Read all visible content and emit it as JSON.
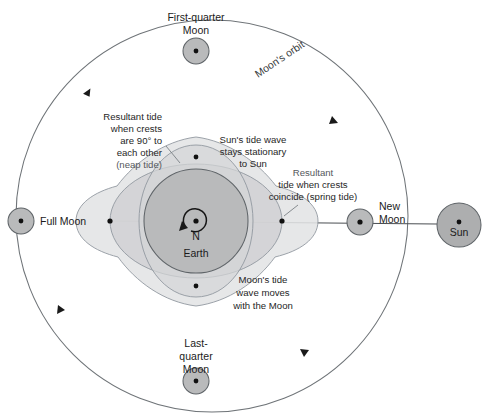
{
  "diagram": {
    "canvas": {
      "width": 492,
      "height": 414
    },
    "colors": {
      "background": "#ffffff",
      "earth_fill": "#b9babb",
      "moon_fill": "#b9babb",
      "sun_fill": "#adaeaf",
      "sun_tide_fill": "#d2d3d4",
      "moon_tide_fill": "#d7d8d9",
      "resultant_fill": "#e2e3e4",
      "outline": "#5f6468",
      "orbit_stroke": "#6f7478",
      "text": "#1b1b1b"
    },
    "geometry": {
      "earth_center": {
        "x": 196,
        "y": 221
      },
      "earth_radius": 52,
      "orbit_center": {
        "x": 212,
        "y": 216
      },
      "orbit_radius_x": 196,
      "orbit_radius_y": 196,
      "sun_center": {
        "x": 459,
        "y": 225
      },
      "sun_radius": 22,
      "moon_radius": 13,
      "sun_tide_rx": 86,
      "sun_tide_ry": 57,
      "moon_tide_rx": 57,
      "moon_tide_ry": 76,
      "resultant_lobe_scale": 1.0
    }
  },
  "bodies": [
    {
      "name": "first-quarter-moon",
      "label": "First-quarter\nMoon",
      "label_lines": [
        "First-quarter",
        "Moon"
      ],
      "cx": 196,
      "cy": 51,
      "r": 13
    },
    {
      "name": "last-quarter-moon",
      "label_lines": [
        "Last-",
        "quarter",
        "Moon"
      ],
      "cx": 196,
      "cy": 381,
      "r": 13
    },
    {
      "name": "full-moon",
      "label_lines": [
        "Full Moon"
      ],
      "cx": 21,
      "cy": 221,
      "r": 13
    },
    {
      "name": "new-moon",
      "label_lines": [
        "New",
        "Moon"
      ],
      "cx": 360,
      "cy": 222,
      "r": 13
    },
    {
      "name": "sun",
      "label_lines": [
        "Sun"
      ],
      "cx": 459,
      "cy": 225,
      "r": 22
    }
  ],
  "labels": {
    "first_quarter_moon": {
      "line1": "First-quarter",
      "line2": "Moon"
    },
    "last_quarter_moon": {
      "line1": "Last-",
      "line2": "quarter",
      "line3": "Moon"
    },
    "full_moon": "Full Moon",
    "new_moon": {
      "line1": "New",
      "line2": "Moon"
    },
    "sun": "Sun",
    "earth": "Earth",
    "north_pole": "N",
    "moons_orbit": "Moon's orbit",
    "neap_tide": {
      "line1": "Resultant tide",
      "line2": "when crests",
      "line3": "are 90° to",
      "line4": "each other",
      "line5": "(neap tide)"
    },
    "suns_tide_wave": {
      "line1": "Sun's tide wave",
      "line2": "stays stationary",
      "line3": "to Sun"
    },
    "spring_tide": {
      "line1": "Resultant",
      "line2": "tide when crests",
      "line3": "coincide (spring tide)"
    },
    "moons_tide_wave": {
      "line1": "Moon's tide",
      "line2": "wave moves",
      "line3": "with the Moon"
    }
  },
  "annotations": {
    "orbit_direction": "counterclockwise",
    "orbit_arrow_count": 4,
    "earth_rotation": "counterclockwise"
  }
}
